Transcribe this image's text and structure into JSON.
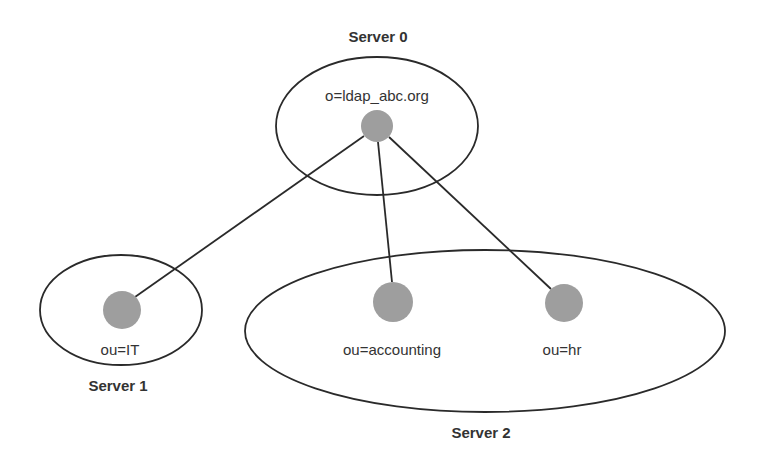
{
  "diagram": {
    "type": "ldap-directory-partition",
    "colors": {
      "stroke": "#2a2a2a",
      "node_fill": "#9e9e9e",
      "text": "#333333",
      "background": "#ffffff"
    },
    "servers": [
      {
        "id": "server0",
        "label": "Server 0",
        "ellipse": {
          "cx": 377,
          "cy": 126,
          "rx": 101,
          "ry": 69
        },
        "label_pos": {
          "x": 378,
          "y": 42
        }
      },
      {
        "id": "server1",
        "label": "Server 1",
        "ellipse": {
          "cx": 121,
          "cy": 310,
          "rx": 81,
          "ry": 55
        },
        "label_pos": {
          "x": 118,
          "y": 391
        }
      },
      {
        "id": "server2",
        "label": "Server 2",
        "ellipse": {
          "cx": 485,
          "cy": 331,
          "rx": 240,
          "ry": 81
        },
        "label_pos": {
          "x": 481,
          "y": 438
        }
      }
    ],
    "nodes": [
      {
        "id": "root",
        "label": "o=ldap_abc.org",
        "server": "server0",
        "cx": 377,
        "cy": 126,
        "r": 16,
        "label_pos": {
          "x": 377,
          "y": 96
        }
      },
      {
        "id": "it",
        "label": "ou=IT",
        "server": "server1",
        "cx": 122,
        "cy": 310,
        "r": 19,
        "label_pos": {
          "x": 120,
          "y": 350
        }
      },
      {
        "id": "accounting",
        "label": "ou=accounting",
        "server": "server2",
        "cx": 393,
        "cy": 302,
        "r": 20,
        "label_pos": {
          "x": 392,
          "y": 350
        }
      },
      {
        "id": "hr",
        "label": "ou=hr",
        "server": "server2",
        "cx": 564,
        "cy": 303,
        "r": 19,
        "label_pos": {
          "x": 562,
          "y": 350
        }
      }
    ],
    "edges": [
      {
        "from": "root",
        "to": "it"
      },
      {
        "from": "root",
        "to": "accounting"
      },
      {
        "from": "root",
        "to": "hr"
      }
    ]
  }
}
